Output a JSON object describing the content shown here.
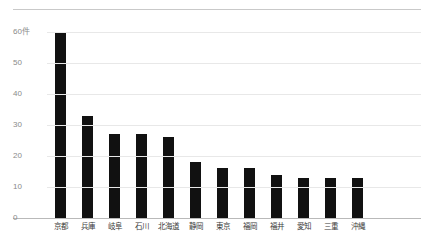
{
  "chart_data": {
    "type": "bar",
    "title": "",
    "subtitle": "",
    "xlabel": "",
    "ylabel": "",
    "unit_label": "件",
    "categories": [
      "京都",
      "兵庫",
      "岐阜",
      "石川",
      "北海道",
      "静岡",
      "東京",
      "福岡",
      "福井",
      "愛知",
      "三重",
      "沖縄"
    ],
    "values": [
      60,
      33,
      27,
      27,
      26,
      18,
      16,
      16,
      14,
      13,
      13,
      13
    ],
    "ylim": [
      0,
      60
    ],
    "ytick_values": [
      0,
      10,
      20,
      30,
      40,
      50,
      60
    ],
    "ytick_labels": [
      "0",
      "10",
      "20",
      "30",
      "40",
      "50",
      "60件"
    ],
    "grid": true,
    "legend": "none",
    "bar_color": "#111111",
    "gridline_color": "#e8e8e8",
    "axis_color": "#b9b9b9",
    "tick_label_color": "#8a8a8a",
    "category_label_color": "#3b3b3b",
    "background_color": "#ffffff"
  }
}
